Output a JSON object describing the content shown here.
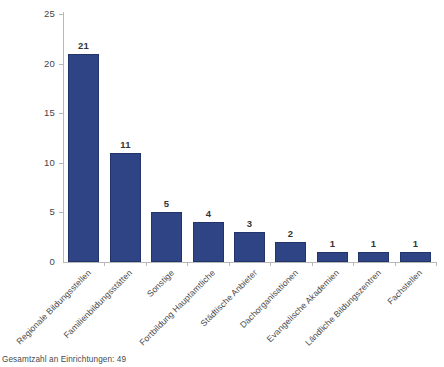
{
  "chart_data": {
    "type": "bar",
    "title": "",
    "subtitle": "",
    "xlabel": "",
    "ylabel": "",
    "categories": [
      "Regionale Bildungsstellen",
      "Familienbildungsstätten",
      "Sonstige",
      "Fortbildung Hauptamtliche",
      "Städtische Anbieter",
      "Dachorganisationen",
      "Evangelische Akademien",
      "Ländliche Bildungszentren",
      "Fachstellen"
    ],
    "values": [
      21,
      11,
      5,
      4,
      3,
      2,
      1,
      1,
      1
    ],
    "value_labels": [
      "21",
      "11",
      "5",
      "4",
      "3",
      "2",
      "1",
      "1",
      "1"
    ],
    "ylim": [
      0,
      25
    ],
    "yticks": [
      0,
      5,
      10,
      15,
      20,
      25
    ],
    "ytick_labels": [
      "0",
      "5",
      "10",
      "15",
      "20",
      "25"
    ],
    "grid": false,
    "legend": false,
    "legend_position": "none",
    "bar_color": "#2e4484",
    "bar_border_color": "#22346a",
    "axis_color": "#b9b9b9",
    "background_color": "#ffffff",
    "label_rotation_deg": -45
  },
  "footnote": {
    "text": "Gesamtzahl an Einrichtungen: 49"
  }
}
